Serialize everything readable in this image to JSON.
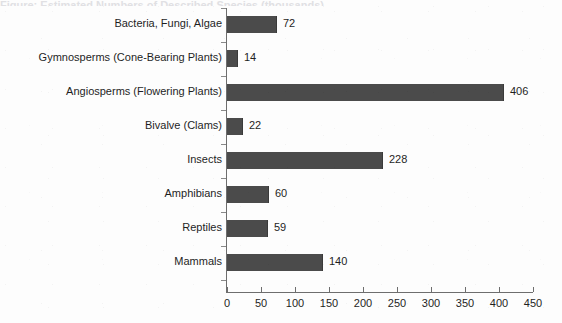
{
  "title_remnant": "Figure: Estimated Numbers of Described Species (thousands)",
  "chart_data": {
    "type": "bar",
    "orientation": "horizontal",
    "title": "",
    "xlabel": "",
    "ylabel": "",
    "xlim": [
      0,
      450
    ],
    "xticks": [
      0,
      50,
      100,
      150,
      200,
      250,
      300,
      350,
      400,
      450
    ],
    "grid": false,
    "legend": false,
    "bar_color": "#4b4b4b",
    "axis_color": "#6e6e6e",
    "categories": [
      "Bacteria, Fungi, Algae",
      "Gymnosperms (Cone-Bearing Plants)",
      "Angiosperms (Flowering Plants)",
      "Bivalve (Clams)",
      "Insects",
      "Amphibians",
      "Reptiles",
      "Mammals"
    ],
    "values": [
      72,
      14,
      406,
      22,
      228,
      60,
      59,
      140
    ],
    "value_labels": [
      "72",
      "14",
      "406",
      "22",
      "228",
      "60",
      "59",
      "140"
    ],
    "tick_labels": [
      "0",
      "50",
      "100",
      "150",
      "200",
      "250",
      "300",
      "350",
      "400",
      "450"
    ]
  }
}
